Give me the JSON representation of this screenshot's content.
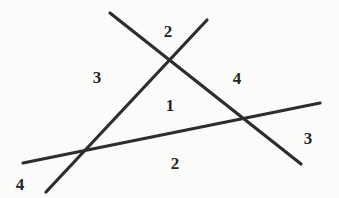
{
  "figure": {
    "width": 339,
    "height": 198,
    "background_color": "#fbfbf9",
    "stroke_color": "#2d2d2d",
    "label_color": "#262626",
    "stroke_width": 3.2
  },
  "lines": [
    {
      "name": "line-upper-left-to-lower-right",
      "x1": 110,
      "y1": 13,
      "x2": 301,
      "y2": 164
    },
    {
      "name": "line-upper-right-to-lower-left",
      "x1": 207,
      "y1": 20,
      "x2": 46,
      "y2": 192
    },
    {
      "name": "line-near-horizontal",
      "x1": 23,
      "y1": 163,
      "x2": 320,
      "y2": 103
    }
  ],
  "intersections": [
    {
      "name": "apex-intersection",
      "x": 172,
      "y": 62
    },
    {
      "name": "left-base-intersection",
      "x": 85,
      "y": 152
    },
    {
      "name": "right-base-intersection",
      "x": 248,
      "y": 120
    }
  ],
  "labels": [
    {
      "name": "label-top",
      "text": "2",
      "x": 168,
      "y": 31
    },
    {
      "name": "label-left",
      "text": "3",
      "x": 97,
      "y": 77
    },
    {
      "name": "label-right",
      "text": "4",
      "x": 237,
      "y": 78
    },
    {
      "name": "label-center",
      "text": "1",
      "x": 170,
      "y": 105
    },
    {
      "name": "label-bottom",
      "text": "2",
      "x": 175,
      "y": 163
    },
    {
      "name": "label-right-outer",
      "text": "3",
      "x": 308,
      "y": 138
    },
    {
      "name": "label-bottom-left",
      "text": "4",
      "x": 20,
      "y": 184
    }
  ]
}
